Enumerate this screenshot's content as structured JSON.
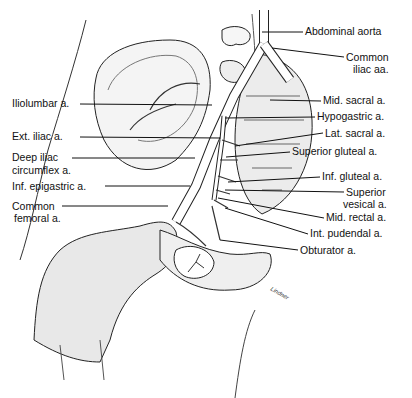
{
  "figure": {
    "artist_signature": "Lindner"
  },
  "labels_left": [
    {
      "id": "iliolumbar",
      "text": "Iliolumbar a.",
      "x": 14,
      "y": 98,
      "line_to": [
        212,
        105
      ]
    },
    {
      "id": "ext-iliac",
      "text": "Ext. iliac a.",
      "x": 14,
      "y": 131,
      "line_to": [
        220,
        138
      ]
    },
    {
      "id": "deep-iliac-1",
      "text": "Deep iliac",
      "x": 14,
      "y": 153,
      "line_to": [
        195,
        158
      ]
    },
    {
      "id": "deep-iliac-2",
      "text": "circumflex a.",
      "x": 14,
      "y": 166
    },
    {
      "id": "inf-epigastric",
      "text": "Inf. epigastric a.",
      "x": 14,
      "y": 181,
      "line_to": [
        190,
        186
      ]
    },
    {
      "id": "common-femoral-1",
      "text": "Common",
      "x": 14,
      "y": 201,
      "line_to": [
        168,
        206
      ]
    },
    {
      "id": "common-femoral-2",
      "text": "femoral a.",
      "x": 16,
      "y": 213
    }
  ],
  "labels_right": [
    {
      "id": "abdominal-aorta",
      "text": "Abdominal aorta",
      "x": 305,
      "y": 25,
      "line_from": [
        262,
        32
      ]
    },
    {
      "id": "common-iliac-1",
      "text": "Common",
      "x": 346,
      "y": 52,
      "line_from": [
        272,
        48
      ]
    },
    {
      "id": "common-iliac-2",
      "text": "iliac aa.",
      "x": 353,
      "y": 64
    },
    {
      "id": "mid-sacral",
      "text": "Mid. sacral a.",
      "x": 323,
      "y": 95,
      "line_from": [
        270,
        100
      ]
    },
    {
      "id": "hypogastric",
      "text": "Hypogastric a.",
      "x": 317,
      "y": 111,
      "line_from": [
        225,
        118
      ]
    },
    {
      "id": "lat-sacral",
      "text": "Lat. sacral a.",
      "x": 325,
      "y": 128,
      "line_from": [
        235,
        146
      ]
    },
    {
      "id": "superior-gluteal",
      "text": "Superior gluteal a.",
      "x": 292,
      "y": 146,
      "line_from": [
        226,
        157
      ]
    },
    {
      "id": "inf-gluteal",
      "text": "Inf. gluteal a.",
      "x": 322,
      "y": 171,
      "line_from": [
        228,
        182
      ]
    },
    {
      "id": "superior-vesical-1",
      "text": "Superior",
      "x": 346,
      "y": 187,
      "line_from": [
        225,
        190
      ]
    },
    {
      "id": "superior-vesical-2",
      "text": "vesical a.",
      "x": 343,
      "y": 199
    },
    {
      "id": "mid-rectal",
      "text": "Mid. rectal a.",
      "x": 326,
      "y": 212,
      "line_from": [
        218,
        198
      ]
    },
    {
      "id": "int-pudendal",
      "text": "Int. pudendal a.",
      "x": 310,
      "y": 228,
      "line_from": [
        225,
        208
      ]
    },
    {
      "id": "obturator",
      "text": "Obturator a.",
      "x": 300,
      "y": 245,
      "line_from": [
        220,
        240
      ]
    }
  ]
}
